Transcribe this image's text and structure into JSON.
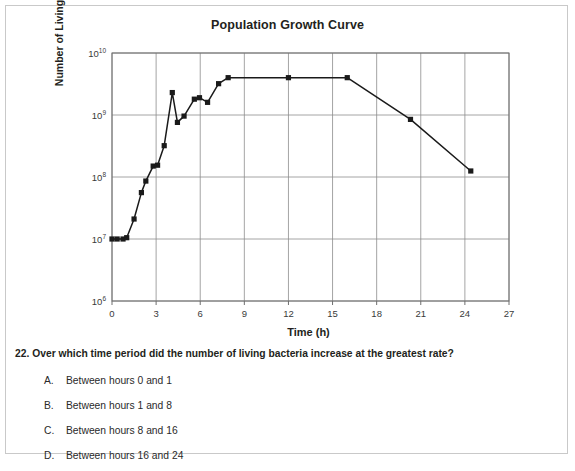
{
  "chart_data": {
    "type": "line",
    "title": "Population Growth Curve",
    "xlabel": "Time (h)",
    "ylabel": "Number of Living Cells",
    "xlim": [
      0,
      27
    ],
    "ylim_log10": [
      6,
      10
    ],
    "yscale": "log",
    "grid": true,
    "legend": "none",
    "xticks": [
      "0",
      "3",
      "6",
      "9",
      "12",
      "15",
      "18",
      "21",
      "24",
      "27"
    ],
    "xtick_values": [
      0,
      3,
      6,
      9,
      12,
      15,
      18,
      21,
      24,
      27
    ],
    "yticks": [
      "10¹⁰",
      "10⁹",
      "10⁸",
      "10⁷",
      "10⁶"
    ],
    "ytick_bases": [
      "10",
      "10",
      "10",
      "10",
      "10"
    ],
    "ytick_exponents": [
      "10",
      "9",
      "8",
      "7",
      "6"
    ],
    "ytick_values": [
      10000000000.0,
      1000000000.0,
      100000000.0,
      10000000.0,
      1000000.0
    ],
    "series": [
      {
        "name": "Living cells",
        "marker": "square",
        "color": "#1a1a1a",
        "x": [
          0.0,
          0.35,
          0.75,
          1.0,
          1.5,
          2.0,
          2.3,
          2.8,
          3.1,
          3.55,
          4.1,
          4.45,
          4.9,
          5.6,
          5.95,
          6.5,
          7.25,
          7.9,
          12.0,
          16.0,
          20.3,
          24.4
        ],
        "y": [
          10000000.0,
          10000000.0,
          10000000.0,
          10500000.0,
          21000000.0,
          56000000.0,
          86000000.0,
          150000000.0,
          155000000.0,
          320000000.0,
          2300000000.0,
          760000000.0,
          960000000.0,
          1800000000.0,
          1900000000.0,
          1600000000.0,
          3200000000.0,
          4000000000.0,
          4000000000.0,
          4000000000.0,
          850000000.0,
          125000000.0
        ]
      }
    ]
  },
  "chart": {
    "title": "Population Growth Curve",
    "xlabel": "Time (h)",
    "ylabel": "Number of Living Cells"
  },
  "question": {
    "number": "22.",
    "text": "22. Over which time period did the number of living bacteria increase at the greatest rate?",
    "options": [
      {
        "letter": "A.",
        "text": "Between hours 0 and 1"
      },
      {
        "letter": "B.",
        "text": "Between hours 1 and 8"
      },
      {
        "letter": "C.",
        "text": "Between hours 8 and 16"
      },
      {
        "letter": "D.",
        "text": "Between hours 16 and 24"
      }
    ]
  },
  "colors": {
    "ink": "#231f20",
    "grid": "#8d8d8d",
    "axis": "#6e6e6e",
    "line": "#1a1a1a",
    "border": "#c9c9c9"
  }
}
